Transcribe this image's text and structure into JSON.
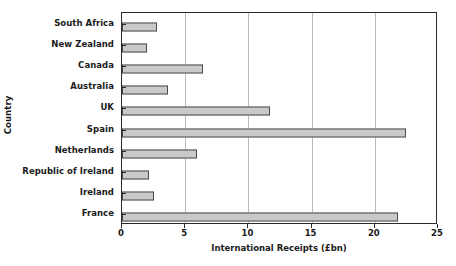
{
  "chart_data": {
    "type": "bar",
    "orientation": "horizontal",
    "title": "",
    "xlabel": "International Receipts (£bn)",
    "ylabel": "Country",
    "categories": [
      "South Africa",
      "New Zealand",
      "Canada",
      "Australia",
      "UK",
      "Spain",
      "Netherlands",
      "Republic of Ireland",
      "Ireland",
      "France"
    ],
    "values": [
      2.8,
      2.0,
      6.4,
      3.6,
      11.7,
      22.5,
      5.9,
      2.1,
      2.5,
      21.8
    ],
    "xlim": [
      0,
      25
    ],
    "xticks": [
      0,
      5,
      10,
      15,
      20,
      25
    ],
    "xtick_labels": [
      "0",
      "5",
      "10",
      "15",
      "20",
      "25"
    ],
    "grid": "vertical",
    "legend": "none",
    "bar_fill_color": "#c9c9c9",
    "bar_edge_color": "#4a4a4a",
    "gridline_color": "#b9b9b9",
    "axis_color": "#2a2a2a"
  }
}
